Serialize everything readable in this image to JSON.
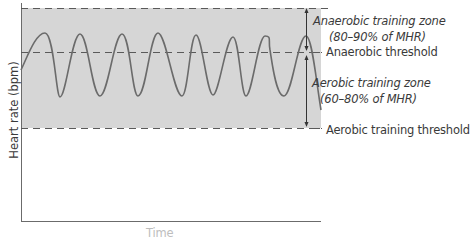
{
  "diagram": {
    "y_axis_label": "Heart rate (bpm)",
    "x_axis_label": "Time",
    "zones": [
      {
        "name": "Anaerobic training zone",
        "range": "(80–90% of MHR)"
      },
      {
        "name": "Aerobic training zone",
        "range": "(60–80% of MHR)"
      }
    ],
    "thresholds": [
      {
        "name": "Anaerobic threshold"
      },
      {
        "name": "Aerobic training threshold"
      }
    ],
    "colors": {
      "zone_fill": "#d6d6d6",
      "line": "#6b6b6b",
      "dash": "#5a5a5a",
      "text": "#3a3a3a"
    }
  }
}
